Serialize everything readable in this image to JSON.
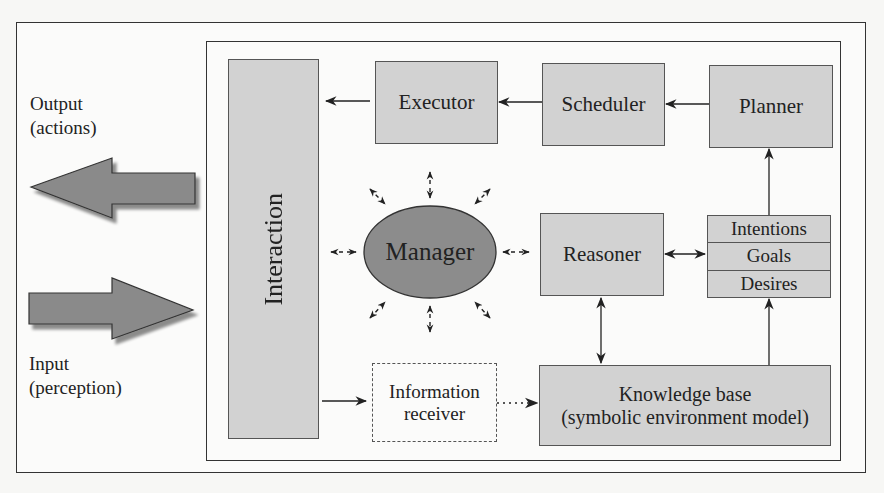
{
  "diagram": {
    "type": "agent-architecture",
    "external": {
      "output_label_line1": "Output",
      "output_label_line2": "(actions)",
      "input_label_line1": "Input",
      "input_label_line2": "(perception)"
    },
    "nodes": {
      "interaction": "Interaction",
      "executor": "Executor",
      "scheduler": "Scheduler",
      "planner": "Planner",
      "manager": "Manager",
      "reasoner": "Reasoner",
      "intentions": "Intentions",
      "goals": "Goals",
      "desires": "Desires",
      "info_receiver_line1": "Information",
      "info_receiver_line2": "receiver",
      "knowledge_base_line1": "Knowledge base",
      "knowledge_base_line2": "(symbolic environment model)"
    },
    "edges": [
      {
        "from": "Planner",
        "to": "Scheduler",
        "style": "solid"
      },
      {
        "from": "Scheduler",
        "to": "Executor",
        "style": "solid"
      },
      {
        "from": "Executor",
        "to": "Interaction",
        "style": "solid"
      },
      {
        "from": "Interaction",
        "to": "Information receiver",
        "style": "solid"
      },
      {
        "from": "Information receiver",
        "to": "Knowledge base",
        "style": "dotted"
      },
      {
        "from": "Knowledge base",
        "to": "Reasoner",
        "style": "bidirectional"
      },
      {
        "from": "Reasoner",
        "to": "Intentions/Goals/Desires",
        "style": "bidirectional"
      },
      {
        "from": "Knowledge base",
        "to": "Desires",
        "style": "solid"
      },
      {
        "from": "Intentions",
        "to": "Planner",
        "style": "solid"
      },
      {
        "from": "Manager",
        "to": "all",
        "style": "dashed-bidirectional-radial"
      }
    ],
    "colors": {
      "box_fill": "#d2d2d2",
      "manager_fill": "#8c8c8c",
      "arrow_fill": "#8a8a8a",
      "stroke": "#333333"
    }
  }
}
